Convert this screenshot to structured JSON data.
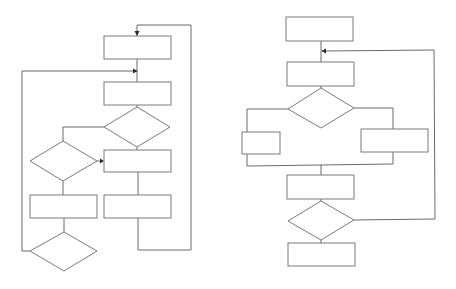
{
  "diagram": {
    "title": "",
    "colors": {
      "background": "#ffffff",
      "stroke": "#7a7a7a",
      "connector": "#6a6a6a",
      "arrowhead": "#2a2a2a"
    },
    "flowcharts": [
      {
        "name": "left-flowchart",
        "nodes": [
          {
            "id": "L1",
            "type": "process",
            "label": ""
          },
          {
            "id": "L2",
            "type": "process",
            "label": ""
          },
          {
            "id": "L3",
            "type": "decision",
            "label": ""
          },
          {
            "id": "L4",
            "type": "decision",
            "label": ""
          },
          {
            "id": "L5",
            "type": "process",
            "label": ""
          },
          {
            "id": "L6",
            "type": "process",
            "label": ""
          },
          {
            "id": "L7",
            "type": "process",
            "label": ""
          },
          {
            "id": "L8",
            "type": "decision",
            "label": ""
          }
        ],
        "edges": [
          {
            "from": "L1",
            "to": "L2"
          },
          {
            "from": "L2",
            "to": "L3"
          },
          {
            "from": "L3",
            "to": "L4",
            "label": ""
          },
          {
            "from": "L3",
            "to": "L5",
            "label": ""
          },
          {
            "from": "L4",
            "to": "L5",
            "label": ""
          },
          {
            "from": "L4",
            "to": "L6",
            "label": ""
          },
          {
            "from": "L5",
            "to": "L7"
          },
          {
            "from": "L6",
            "to": "L8"
          },
          {
            "from": "L7",
            "to": "L1",
            "label": "loop"
          },
          {
            "from": "L8",
            "to": "L2",
            "label": "loop"
          }
        ]
      },
      {
        "name": "right-flowchart",
        "nodes": [
          {
            "id": "R1",
            "type": "process",
            "label": ""
          },
          {
            "id": "R2",
            "type": "process",
            "label": ""
          },
          {
            "id": "R3",
            "type": "decision",
            "label": ""
          },
          {
            "id": "R4",
            "type": "process",
            "label": ""
          },
          {
            "id": "R5",
            "type": "process",
            "label": ""
          },
          {
            "id": "R6",
            "type": "process",
            "label": ""
          },
          {
            "id": "R7",
            "type": "decision",
            "label": ""
          },
          {
            "id": "R8",
            "type": "process",
            "label": ""
          }
        ],
        "edges": [
          {
            "from": "R1",
            "to": "R2"
          },
          {
            "from": "R2",
            "to": "R3"
          },
          {
            "from": "R3",
            "to": "R4",
            "label": ""
          },
          {
            "from": "R3",
            "to": "R5",
            "label": ""
          },
          {
            "from": "R4",
            "to": "R6"
          },
          {
            "from": "R5",
            "to": "R6"
          },
          {
            "from": "R6",
            "to": "R7"
          },
          {
            "from": "R7",
            "to": "R8",
            "label": ""
          },
          {
            "from": "R7",
            "to": "R2",
            "label": "loop"
          }
        ]
      }
    ]
  }
}
